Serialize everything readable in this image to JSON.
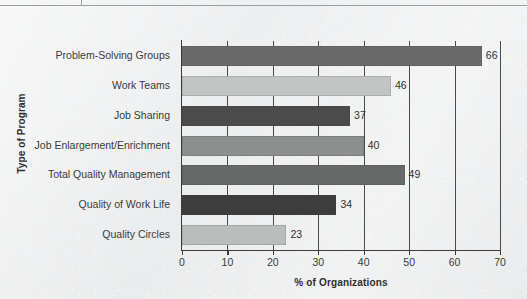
{
  "figure": {
    "background_color": "#edeeef",
    "axis_color": "#3b3b3b"
  },
  "chart_data": {
    "type": "bar",
    "orientation": "horizontal",
    "title": "",
    "xlabel": "% of Organizations",
    "ylabel": "Type of Program",
    "xlim": [
      0,
      70
    ],
    "xticks": [
      0,
      10,
      20,
      30,
      40,
      50,
      60,
      70
    ],
    "xtick_labels": [
      "0",
      "10",
      "20",
      "30",
      "40",
      "50",
      "60",
      "70"
    ],
    "grid": true,
    "grid_axis": "x",
    "legend": null,
    "categories": [
      "Problem-Solving Groups",
      "Work Teams",
      "Job Sharing",
      "Job Enlargement/Enrichment",
      "Total Quality Management",
      "Quality of Work Life",
      "Quality Circles"
    ],
    "values": [
      66,
      46,
      37,
      40,
      49,
      34,
      23
    ],
    "value_labels": [
      "66",
      "46",
      "37",
      "40",
      "49",
      "34",
      "23"
    ],
    "bar_colors": [
      "#6a6a6a",
      "#c3c4c4",
      "#4b4b4b",
      "#8d8e8e",
      "#676868",
      "#3d3d3d",
      "#bbbcbc"
    ]
  }
}
